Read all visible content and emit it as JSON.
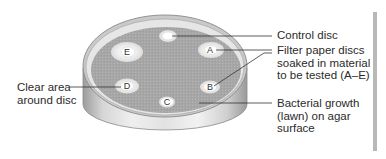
{
  "diagram": {
    "discs": [
      {
        "id": "control",
        "letter": ""
      },
      {
        "id": "E",
        "letter": "E"
      },
      {
        "id": "A",
        "letter": "A"
      },
      {
        "id": "D",
        "letter": "D"
      },
      {
        "id": "B",
        "letter": "B"
      },
      {
        "id": "C",
        "letter": "C"
      }
    ],
    "labels": {
      "control_disc": "Control disc",
      "filter_paper": [
        "Filter paper discs",
        "soaked in material",
        "to be tested (A–E)"
      ],
      "bacterial_growth": [
        "Bacterial growth",
        "(lawn) on agar",
        "surface"
      ],
      "clear_area": [
        "Clear area",
        "around disc"
      ]
    },
    "colors": {
      "agar_lawn": "#a9a9a9",
      "dish_wall": "#d9d9d9",
      "clear_zone": "#ececec",
      "disc": "#ffffff",
      "leader_line": "#333333",
      "text": "#2b2b2b",
      "side_bar": "#b8b8b8"
    }
  }
}
